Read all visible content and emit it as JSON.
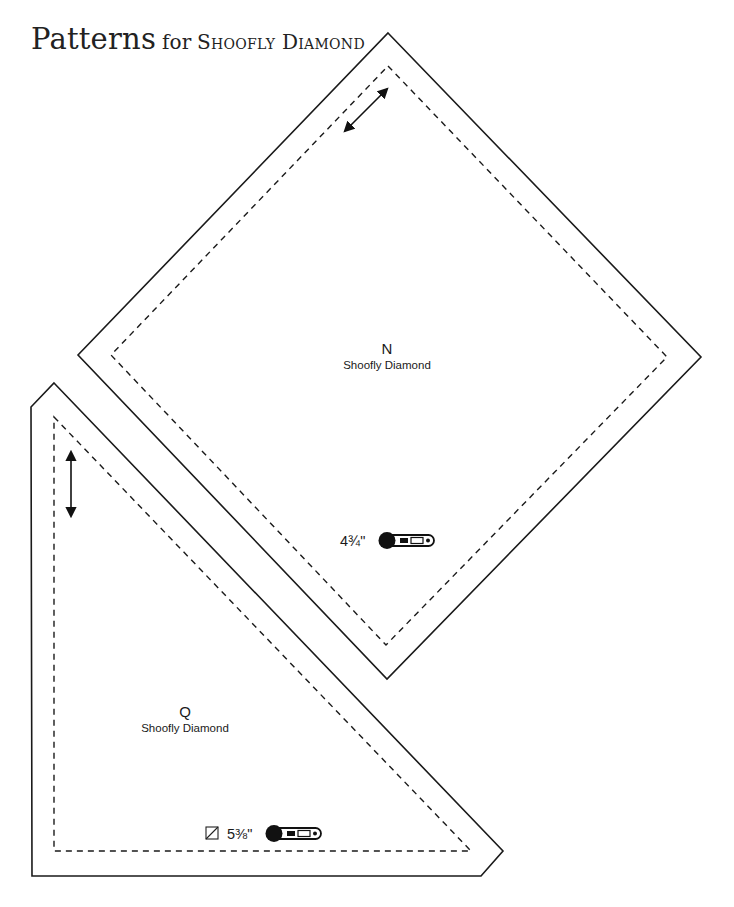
{
  "page": {
    "title_main": "Patterns",
    "title_for": "for",
    "title_subject": "Shoofly Diamond"
  },
  "patterns": [
    {
      "id": "N",
      "letter": "N",
      "name": "Shoofly Diamond",
      "shape": "square-on-point",
      "measurement": "4¾\"",
      "cut_icon": "rotary-cutter-icon",
      "grain_arrow": "diagonal",
      "stroke_color": "#1a1a1a"
    },
    {
      "id": "Q",
      "letter": "Q",
      "name": "Shoofly Diamond",
      "shape": "half-square-triangle",
      "measurement": "5⅜\"",
      "prefix_icon": "half-square-triangle-icon",
      "cut_icon": "rotary-cutter-icon",
      "grain_arrow": "vertical",
      "stroke_color": "#1a1a1a"
    }
  ]
}
